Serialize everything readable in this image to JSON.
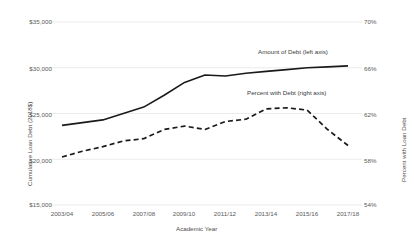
{
  "chart_data": {
    "type": "line",
    "title": "",
    "xlabel": "Academic Year",
    "ylabel": "Cumulative Loan Debt (2018$)",
    "y2label": "Percent with Loan Debt",
    "grid": true,
    "legend_position": "inline-annotation",
    "x": [
      "2003/04",
      "2004/05",
      "2005/06",
      "2006/07",
      "2007/08",
      "2008/09",
      "2009/10",
      "2010/11",
      "2011/12",
      "2012/13",
      "2013/14",
      "2014/15",
      "2015/16",
      "2016/17",
      "2017/18"
    ],
    "xtick_labels": [
      "2003/04",
      "2005/06",
      "2007/08",
      "2009/10",
      "2011/12",
      "2013/14",
      "2015/16",
      "2017/18"
    ],
    "ylim": [
      15000,
      35000
    ],
    "ytick_labels": [
      "$35,000",
      "$30,000",
      "$25,000",
      "$20,000",
      "$15,000"
    ],
    "ytick_values": [
      35000,
      30000,
      25000,
      20000,
      15000
    ],
    "y2lim": [
      54,
      70
    ],
    "y2tick_labels": [
      "70%",
      "66%",
      "62%",
      "58%",
      "54%"
    ],
    "y2tick_values": [
      70,
      66,
      62,
      58,
      54
    ],
    "series": [
      {
        "name": "Amount of Debt (left axis)",
        "axis": "left",
        "style": "solid",
        "color": "#1a1a1a",
        "values": [
          23700,
          24000,
          24300,
          25000,
          25700,
          27000,
          28400,
          29200,
          29100,
          29400,
          29600,
          29800,
          30000,
          30100,
          30200
        ]
      },
      {
        "name": "Percent with Debt (right axis)",
        "axis": "right",
        "style": "dashed",
        "color": "#1a1a1a",
        "values": [
          58.2,
          58.7,
          59.1,
          59.6,
          59.8,
          60.6,
          60.9,
          60.6,
          61.3,
          61.5,
          62.4,
          62.5,
          62.3,
          60.6,
          59.2
        ]
      }
    ],
    "annotations": [
      {
        "text": "Amount of Debt (left axis)",
        "x_px": 258,
        "y_px": 52
      },
      {
        "text": "Percent with Debt (right axis)",
        "x_px": 247,
        "y_px": 93
      }
    ]
  }
}
